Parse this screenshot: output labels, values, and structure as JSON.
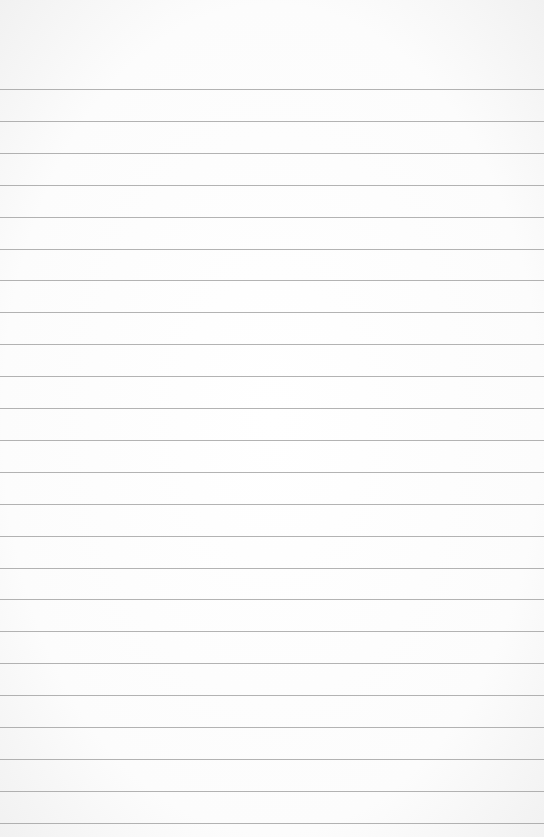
{
  "paper": {
    "type": "lined-paper",
    "line_color": "#9a9a9a",
    "background_color": "#fbfbfb",
    "first_line_y": 89,
    "line_spacing": 31.9,
    "line_count": 24
  }
}
